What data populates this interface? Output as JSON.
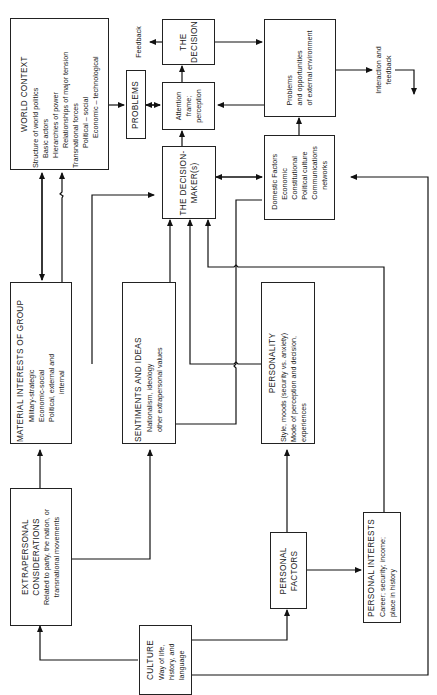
{
  "diagram": {
    "orientation": "rotated 90deg counter-clockwise (text reads bottom to top)",
    "nodes": {
      "world_context": {
        "title": "WORLD CONTEXT",
        "lines": [
          "Structure of world politics",
          "Basic actors",
          "Hierarchies of power",
          "Relationships of major tension",
          "Transnational forces",
          "Political  –  social",
          "Economic  –  technological"
        ]
      },
      "problems": {
        "title": "PROBLEMS"
      },
      "attention": {
        "lines": [
          "Attention",
          "frame;",
          "perception"
        ]
      },
      "the_decision": {
        "lines": [
          "THE",
          "DECISION"
        ]
      },
      "external_env": {
        "lines": [
          "Problems",
          "and opportunities",
          "of external environment"
        ]
      },
      "decision_maker": {
        "lines": [
          "THE DECISION-",
          "MAKER(s)"
        ]
      },
      "domestic_factors": {
        "title": "Domestic Factors",
        "lines": [
          "Economic",
          "Constitutional",
          "Political culture",
          "Communications",
          "networks"
        ]
      },
      "material_interests": {
        "title": "MATERIAL INTERESTS OF GROUP",
        "lines": [
          "Military-strategic",
          "Economic-social",
          "Political, external and",
          "internal"
        ]
      },
      "sentiments": {
        "title": "SENTIMENTS AND IDEAS",
        "lines": [
          "Nationalism, ideology",
          "other extrapersonal values"
        ]
      },
      "personality": {
        "title": "PERSONALITY",
        "lines": [
          "Style, moods (security vs. anxiety)",
          "Mode of perception and decision,",
          "experiences"
        ]
      },
      "extrapersonal": {
        "title_lines": [
          "EXTRAPERSONAL",
          "CONSIDERATIONS"
        ],
        "lines": [
          "Related to party, the nation, or",
          "transnational movements"
        ]
      },
      "personal_factors": {
        "lines": [
          "PERSONAL",
          "FACTORS"
        ]
      },
      "personal_interests": {
        "title": "PERSONAL INTERESTS",
        "lines": [
          "Career; security; income;",
          "place in history"
        ]
      },
      "culture": {
        "title": "CULTURE",
        "lines": [
          "Way of life,",
          "history, and",
          "language"
        ]
      }
    },
    "labels": {
      "feedback": "Feedback",
      "interaction": [
        "Interaction and",
        "feedback"
      ]
    }
  }
}
